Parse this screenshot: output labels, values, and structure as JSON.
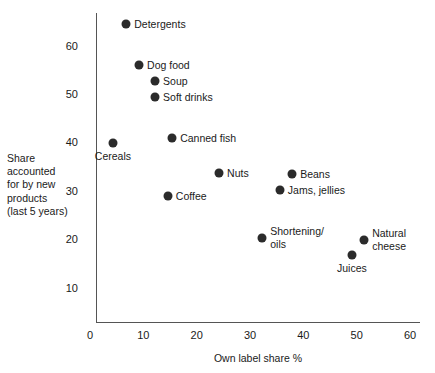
{
  "chart_data": {
    "type": "scatter",
    "title": "",
    "xlabel": "Own label share %",
    "ylabel": "Share accounted for by new products (last 5 years)",
    "ylabel_lines": [
      "Share",
      "accounted",
      "for by  new",
      "products",
      "(last 5 years)"
    ],
    "xlim": [
      0,
      60
    ],
    "ylim": [
      0,
      68
    ],
    "xticks": [
      0,
      10,
      20,
      30,
      40,
      50,
      60
    ],
    "xtick_labels": [
      "0",
      "10",
      "20",
      "30",
      "40",
      "50",
      "60"
    ],
    "yticks": [
      10,
      20,
      30,
      40,
      50,
      60
    ],
    "ytick_labels": [
      "10",
      "20",
      "30",
      "40",
      "50",
      "60"
    ],
    "grid": false,
    "legend": "none",
    "marker_color": "#2b2b2b",
    "axis_color": "#555555",
    "points": [
      {
        "label": "Detergents",
        "x": 6.8,
        "y": 64.6,
        "label_pos": "right"
      },
      {
        "label": "Dog food",
        "x": 9.2,
        "y": 56.1,
        "label_pos": "right"
      },
      {
        "label": "Soup",
        "x": 12.2,
        "y": 52.8,
        "label_pos": "right"
      },
      {
        "label": "Soft drinks",
        "x": 12.2,
        "y": 49.5,
        "label_pos": "right"
      },
      {
        "label": "Canned fish",
        "x": 15.4,
        "y": 41.0,
        "label_pos": "right"
      },
      {
        "label": "Cereals",
        "x": 4.3,
        "y": 39.9,
        "label_pos": "below"
      },
      {
        "label": "Nuts",
        "x": 24.2,
        "y": 33.8,
        "label_pos": "right"
      },
      {
        "label": "Beans",
        "x": 37.9,
        "y": 33.6,
        "label_pos": "right"
      },
      {
        "label": "Jams, jellies",
        "x": 35.6,
        "y": 30.3,
        "label_pos": "right"
      },
      {
        "label": "Coffee",
        "x": 14.6,
        "y": 29.0,
        "label_pos": "right"
      },
      {
        "label": "Shortening/\noils",
        "x": 32.3,
        "y": 20.3,
        "label_pos": "right"
      },
      {
        "label": "Natural\ncheese",
        "x": 51.4,
        "y": 19.9,
        "label_pos": "right"
      },
      {
        "label": "Juices",
        "x": 49.1,
        "y": 16.8,
        "label_pos": "below"
      }
    ]
  }
}
